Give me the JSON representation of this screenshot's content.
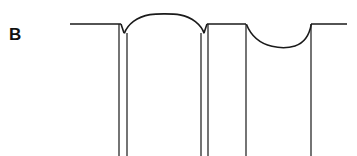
{
  "figure": {
    "panel_label": "B",
    "background_color": "#ffffff",
    "line_color": "#1a1a1a",
    "descender_color": "#3a3a3a",
    "width": 357,
    "height": 156
  },
  "chart_data": {
    "type": "line",
    "title": "B",
    "xlabel": "",
    "ylabel": "",
    "xlim": [
      0,
      357
    ],
    "ylim": [
      156,
      0
    ],
    "grid": false,
    "legend": null,
    "axes_visible": false,
    "tick_labels": {
      "x": [],
      "y": []
    },
    "annotations": [
      {
        "text": "B",
        "x": 9,
        "y": 35,
        "bold": true
      }
    ],
    "series": [
      {
        "name": "baseline-left",
        "kind": "flat-segment",
        "points": [
          [
            70,
            24
          ],
          [
            121,
            24
          ]
        ]
      },
      {
        "name": "notch-1-down",
        "kind": "v-notch-descent",
        "points": [
          [
            121,
            24
          ],
          [
            124,
            33
          ]
        ]
      },
      {
        "name": "arch-rise",
        "kind": "convex-arc",
        "points": [
          [
            124,
            33
          ],
          [
            136,
            21
          ],
          [
            152,
            15
          ],
          [
            165,
            14
          ]
        ]
      },
      {
        "name": "arch-fall",
        "kind": "convex-arc",
        "points": [
          [
            165,
            14
          ],
          [
            180,
            15
          ],
          [
            195,
            21
          ],
          [
            204,
            33
          ]
        ]
      },
      {
        "name": "notch-2-up",
        "kind": "v-notch-ascent",
        "points": [
          [
            204,
            33
          ],
          [
            207,
            24
          ]
        ]
      },
      {
        "name": "baseline-middle",
        "kind": "flat-segment",
        "points": [
          [
            207,
            24
          ],
          [
            246,
            24
          ]
        ]
      },
      {
        "name": "valley-fall",
        "kind": "concave-arc",
        "points": [
          [
            246,
            24
          ],
          [
            256,
            33
          ],
          [
            270,
            43
          ],
          [
            285,
            47
          ]
        ]
      },
      {
        "name": "valley-rise",
        "kind": "concave-arc",
        "points": [
          [
            285,
            47
          ],
          [
            297,
            45
          ],
          [
            306,
            36
          ],
          [
            311,
            24
          ]
        ]
      },
      {
        "name": "baseline-right",
        "kind": "flat-segment",
        "points": [
          [
            311,
            24
          ],
          [
            347,
            24
          ]
        ]
      }
    ],
    "descenders": [
      {
        "name": "descender-1a",
        "x": 119,
        "y_top": 24,
        "y_bottom": 156
      },
      {
        "name": "descender-1b",
        "x": 127,
        "y_top": 33,
        "y_bottom": 156
      },
      {
        "name": "descender-2a",
        "x": 201,
        "y_top": 33,
        "y_bottom": 156
      },
      {
        "name": "descender-2b",
        "x": 208,
        "y_top": 24,
        "y_bottom": 156
      },
      {
        "name": "descender-3",
        "x": 246,
        "y_top": 24,
        "y_bottom": 156
      },
      {
        "name": "descender-4",
        "x": 311,
        "y_top": 24,
        "y_bottom": 156
      }
    ],
    "features": {
      "baseline_y": 24,
      "arch_peak": {
        "x": 165,
        "y": 14
      },
      "valley_bottom": {
        "x": 290,
        "y": 47
      },
      "notch_depth_y": 33,
      "descender_count": 6
    }
  }
}
